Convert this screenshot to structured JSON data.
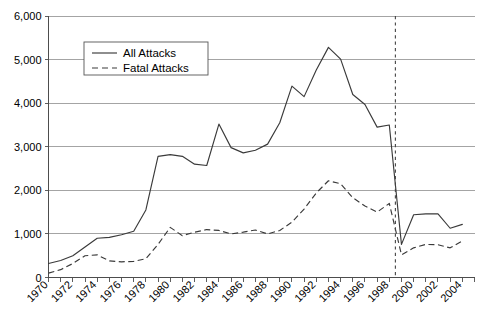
{
  "chart_data": {
    "type": "line",
    "title": "",
    "xlabel": "",
    "ylabel": "",
    "xlim": [
      1970,
      2005
    ],
    "ylim": [
      0,
      6000
    ],
    "grid": true,
    "legend_position": "top-left-inside",
    "y_ticks": [
      0,
      1000,
      2000,
      3000,
      4000,
      5000,
      6000
    ],
    "y_tick_labels": [
      "0",
      "1,000",
      "2,000",
      "3,000",
      "4,000",
      "5,000",
      "6,000"
    ],
    "x_tick_labels": [
      "1970",
      "1972",
      "1974",
      "1976",
      "1978",
      "1980",
      "1982",
      "1984",
      "1986",
      "1988",
      "1990",
      "1992",
      "1994",
      "1996",
      "1998",
      "2000",
      "2002",
      "2004"
    ],
    "x_minor_ticks_every": 1,
    "x": [
      1970,
      1971,
      1972,
      1973,
      1974,
      1975,
      1976,
      1977,
      1978,
      1979,
      1980,
      1981,
      1982,
      1983,
      1984,
      1985,
      1986,
      1987,
      1988,
      1989,
      1990,
      1991,
      1992,
      1993,
      1994,
      1995,
      1996,
      1997,
      1998,
      1999,
      2000,
      2001,
      2002,
      2003,
      2004
    ],
    "series": [
      {
        "name": "All Attacks",
        "style": "solid",
        "color": "#3a3a3a",
        "values": [
          320,
          390,
          500,
          700,
          900,
          920,
          980,
          1060,
          1550,
          2780,
          2820,
          2780,
          2600,
          2570,
          3520,
          2980,
          2860,
          2920,
          3060,
          3550,
          4390,
          4150,
          4760,
          5280,
          5010,
          4200,
          3970,
          3450,
          3500,
          760,
          1440,
          1460,
          1460,
          1130,
          1220
        ]
      },
      {
        "name": "Fatal Attacks",
        "style": "dashed",
        "color": "#3a3a3a",
        "values": [
          100,
          180,
          320,
          500,
          520,
          380,
          360,
          370,
          430,
          760,
          1150,
          960,
          1040,
          1100,
          1080,
          1000,
          1040,
          1090,
          1000,
          1080,
          1270,
          1570,
          1940,
          2220,
          2150,
          1830,
          1640,
          1500,
          1700,
          520,
          680,
          760,
          750,
          680,
          840
        ]
      }
    ],
    "annotations": [
      {
        "type": "vertical-break-line",
        "x": 1998.5,
        "style": "dashed"
      }
    ]
  },
  "legend": {
    "items": [
      {
        "label": "All Attacks",
        "style": "solid"
      },
      {
        "label": "Fatal Attacks",
        "style": "dashed"
      }
    ]
  }
}
